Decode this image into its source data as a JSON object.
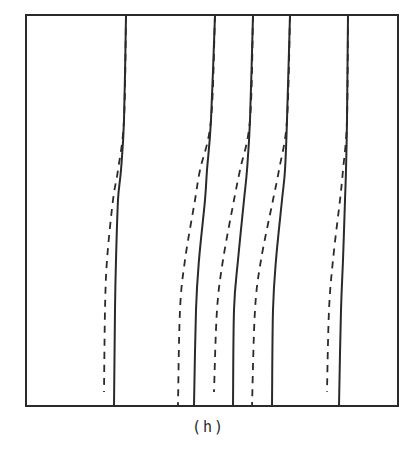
{
  "figure": {
    "caption": "(h)",
    "frame": {
      "x": 26,
      "y": 15,
      "width": 372,
      "height": 391
    },
    "ink_color": "#2a2a2a",
    "line_styles": {
      "solid": {
        "dash": "",
        "width": 2.0
      },
      "dashed": {
        "dash": "7 6",
        "width": 1.8
      }
    },
    "curves": [
      {
        "id": "pair-1",
        "solid": [
          [
            126,
            15
          ],
          [
            124,
            120
          ],
          [
            121,
            170
          ],
          [
            118,
            200
          ],
          [
            116,
            260
          ],
          [
            115,
            310
          ],
          [
            114,
            406
          ]
        ],
        "dashed": [
          [
            126,
            15
          ],
          [
            124,
            120
          ],
          [
            118,
            170
          ],
          [
            113,
            200
          ],
          [
            107,
            260
          ],
          [
            105,
            310
          ],
          [
            104,
            392
          ]
        ]
      },
      {
        "id": "pair-2",
        "solid": [
          [
            215,
            15
          ],
          [
            211,
            120
          ],
          [
            207,
            170
          ],
          [
            205,
            200
          ],
          [
            199,
            260
          ],
          [
            196,
            310
          ],
          [
            194,
            406
          ]
        ],
        "dashed": [
          [
            215,
            15
          ],
          [
            211,
            120
          ],
          [
            200,
            170
          ],
          [
            195,
            200
          ],
          [
            185,
            260
          ],
          [
            180,
            310
          ],
          [
            178,
            406
          ]
        ]
      },
      {
        "id": "pair-3",
        "solid": [
          [
            253,
            15
          ],
          [
            250,
            120
          ],
          [
            247,
            170
          ],
          [
            244,
            200
          ],
          [
            238,
            260
          ],
          [
            234,
            310
          ],
          [
            233,
            406
          ]
        ],
        "dashed": [
          [
            253,
            15
          ],
          [
            250,
            120
          ],
          [
            240,
            170
          ],
          [
            234,
            200
          ],
          [
            223,
            260
          ],
          [
            217,
            310
          ],
          [
            214,
            392
          ]
        ]
      },
      {
        "id": "pair-4",
        "solid": [
          [
            290,
            15
          ],
          [
            287,
            120
          ],
          [
            285,
            170
          ],
          [
            282,
            200
          ],
          [
            276,
            260
          ],
          [
            273,
            310
          ],
          [
            272,
            406
          ]
        ],
        "dashed": [
          [
            290,
            15
          ],
          [
            287,
            120
          ],
          [
            279,
            170
          ],
          [
            273,
            200
          ],
          [
            261,
            260
          ],
          [
            255,
            310
          ],
          [
            252,
            406
          ]
        ]
      },
      {
        "id": "pair-5",
        "solid": [
          [
            348,
            15
          ],
          [
            347,
            120
          ],
          [
            346,
            170
          ],
          [
            345,
            200
          ],
          [
            343,
            260
          ],
          [
            341,
            310
          ],
          [
            339,
            406
          ]
        ],
        "dashed": [
          [
            348,
            15
          ],
          [
            347,
            120
          ],
          [
            343,
            170
          ],
          [
            340,
            200
          ],
          [
            333,
            260
          ],
          [
            329,
            310
          ],
          [
            327,
            392
          ]
        ]
      }
    ]
  }
}
